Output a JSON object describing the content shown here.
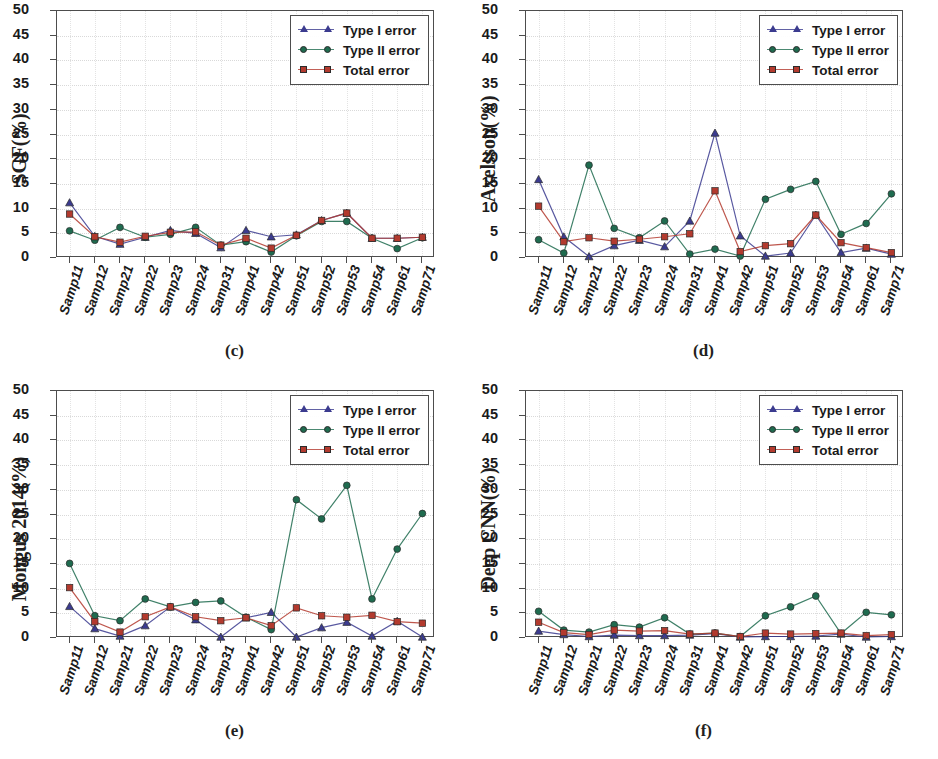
{
  "figure": {
    "width": 938,
    "height": 759,
    "background": "#ffffff"
  },
  "series_styles": {
    "type1": {
      "color": "#3b3b8f",
      "marker": "triangle",
      "label": "Type I error"
    },
    "type2": {
      "color": "#1f6b4f",
      "marker": "circle",
      "label": "Type II error"
    },
    "total": {
      "color": "#b33a2e",
      "marker": "square",
      "label": "Total error"
    }
  },
  "axis": {
    "y_ticks": [
      0,
      5,
      10,
      15,
      20,
      25,
      30,
      35,
      40,
      45,
      50
    ],
    "y_min": 0,
    "y_max": 50,
    "grid": true
  },
  "categories": [
    "Samp11",
    "Samp12",
    "Samp21",
    "Samp22",
    "Samp23",
    "Samp24",
    "Samp31",
    "Samp41",
    "Samp42",
    "Samp51",
    "Samp52",
    "Samp53",
    "Samp54",
    "Samp61",
    "Samp71"
  ],
  "legend_labels": [
    "Type I error",
    "Type II error",
    "Total error"
  ],
  "panels": [
    {
      "key": "c",
      "caption": "(c)",
      "ylabel": "SGF(%)"
    },
    {
      "key": "d",
      "caption": "(d)",
      "ylabel": "Axelsson(%)"
    },
    {
      "key": "e",
      "caption": "(e)",
      "ylabel": "Mongus 2014(%)"
    },
    {
      "key": "f",
      "caption": "(f)",
      "ylabel": "Deep CNN(%)"
    }
  ],
  "chart_data": [
    {
      "type": "line",
      "panel": "c",
      "title": "(c)",
      "xlabel": "",
      "ylabel": "SGF(%)",
      "ylim": [
        0,
        50
      ],
      "grid": true,
      "legend_position": "top-right",
      "categories": [
        "Samp11",
        "Samp12",
        "Samp21",
        "Samp22",
        "Samp23",
        "Samp24",
        "Samp31",
        "Samp41",
        "Samp42",
        "Samp51",
        "Samp52",
        "Samp53",
        "Samp54",
        "Samp61",
        "Samp71"
      ],
      "series": [
        {
          "name": "Type I error",
          "values": [
            11.2,
            4.4,
            2.8,
            4.2,
            5.6,
            5.0,
            2.1,
            5.6,
            4.3,
            4.7,
            7.6,
            9.1,
            4.0,
            4.0,
            4.2
          ]
        },
        {
          "name": "Type II error",
          "values": [
            5.5,
            3.6,
            6.2,
            4.2,
            4.8,
            6.2,
            2.6,
            3.3,
            1.2,
            4.5,
            7.4,
            7.4,
            4.0,
            1.9,
            4.1
          ]
        },
        {
          "name": "Total error",
          "values": [
            8.9,
            4.3,
            3.2,
            4.4,
            5.2,
            5.3,
            2.6,
            4.0,
            2.0,
            4.6,
            7.6,
            9.1,
            4.0,
            4.0,
            4.2
          ]
        }
      ]
    },
    {
      "type": "line",
      "panel": "d",
      "title": "(d)",
      "xlabel": "",
      "ylabel": "Axelsson(%)",
      "ylim": [
        0,
        50
      ],
      "grid": true,
      "legend_position": "top-right",
      "categories": [
        "Samp11",
        "Samp12",
        "Samp21",
        "Samp22",
        "Samp23",
        "Samp24",
        "Samp31",
        "Samp41",
        "Samp42",
        "Samp51",
        "Samp52",
        "Samp53",
        "Samp54",
        "Samp61",
        "Samp71"
      ],
      "series": [
        {
          "name": "Type I error",
          "values": [
            15.9,
            4.3,
            0.3,
            2.5,
            3.6,
            2.3,
            7.5,
            25.3,
            4.5,
            0.4,
            1.0,
            8.7,
            1.1,
            2.0,
            0.8
          ]
        },
        {
          "name": "Type II error",
          "values": [
            3.7,
            1.0,
            18.8,
            6.0,
            4.1,
            7.5,
            0.8,
            1.8,
            0.4,
            11.9,
            13.9,
            15.5,
            4.8,
            7.0,
            13.0
          ]
        },
        {
          "name": "Total error",
          "values": [
            10.5,
            3.3,
            4.1,
            3.4,
            3.8,
            4.3,
            4.9,
            13.6,
            1.3,
            2.5,
            2.9,
            8.7,
            3.1,
            2.1,
            1.1
          ]
        }
      ]
    },
    {
      "type": "line",
      "panel": "e",
      "title": "(e)",
      "xlabel": "",
      "ylabel": "Mongus 2014(%)",
      "ylim": [
        0,
        50
      ],
      "grid": true,
      "legend_position": "top-right",
      "categories": [
        "Samp11",
        "Samp12",
        "Samp21",
        "Samp22",
        "Samp23",
        "Samp24",
        "Samp31",
        "Samp41",
        "Samp42",
        "Samp51",
        "Samp52",
        "Samp53",
        "Samp54",
        "Samp61",
        "Samp71"
      ],
      "series": [
        {
          "name": "Type I error",
          "values": [
            6.4,
            1.9,
            0.4,
            2.5,
            6.3,
            3.7,
            0.2,
            4.1,
            5.2,
            0.2,
            2.1,
            3.2,
            0.4,
            3.4,
            0.2
          ]
        },
        {
          "name": "Type II error",
          "values": [
            15.1,
            4.5,
            3.5,
            7.9,
            6.3,
            7.2,
            7.5,
            4.2,
            1.7,
            28.0,
            24.1,
            30.9,
            7.9,
            18.0,
            25.2
          ]
        },
        {
          "name": "Total error",
          "values": [
            10.2,
            3.3,
            1.2,
            4.3,
            6.3,
            4.3,
            3.5,
            4.1,
            2.5,
            6.1,
            4.5,
            4.2,
            4.6,
            3.3,
            3.0
          ]
        }
      ]
    },
    {
      "type": "line",
      "panel": "f",
      "title": "(f)",
      "xlabel": "",
      "ylabel": "Deep CNN(%)",
      "ylim": [
        0,
        50
      ],
      "grid": true,
      "legend_position": "top-right",
      "categories": [
        "Samp11",
        "Samp12",
        "Samp21",
        "Samp22",
        "Samp23",
        "Samp24",
        "Samp31",
        "Samp41",
        "Samp42",
        "Samp51",
        "Samp52",
        "Samp53",
        "Samp54",
        "Samp61",
        "Samp71"
      ],
      "series": [
        {
          "name": "Type I error",
          "values": [
            1.4,
            0.7,
            0.3,
            0.6,
            0.5,
            0.5,
            0.6,
            0.9,
            0.2,
            0.3,
            0.3,
            0.4,
            0.8,
            0.2,
            0.3
          ]
        },
        {
          "name": "Type II error",
          "values": [
            5.4,
            1.6,
            1.2,
            2.7,
            2.2,
            4.1,
            0.8,
            1.0,
            0.3,
            4.5,
            6.3,
            8.5,
            0.9,
            5.2,
            4.7
          ]
        },
        {
          "name": "Total error",
          "values": [
            3.2,
            1.1,
            0.7,
            1.6,
            1.4,
            1.5,
            0.8,
            1.0,
            0.3,
            1.0,
            0.8,
            0.9,
            1.0,
            0.5,
            0.7
          ]
        }
      ]
    }
  ]
}
